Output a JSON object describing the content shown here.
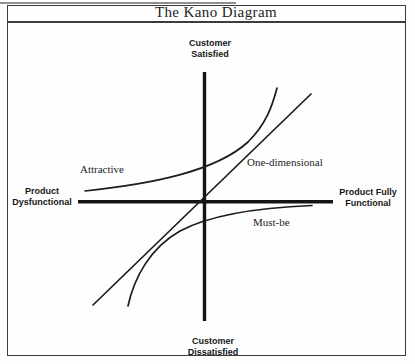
{
  "figure": {
    "title": "The Kano Diagram"
  },
  "axes": {
    "top_label": "Customer\nSatisfied",
    "bottom_label": "Customer\nDissatisfied",
    "left_label": "Product\nDysfunctional",
    "right_label": "Product Fully\nFunctional"
  },
  "curves": {
    "attractive": {
      "label": "Attractive",
      "shape": "concave-up curve, starts just above horizontal axis on left, rises steeply in upper right quadrant"
    },
    "one_dimensional": {
      "label": "One-dimensional",
      "shape": "straight diagonal line through the origin from lower-left to upper-right"
    },
    "must_be": {
      "label": "Must-be",
      "shape": "concave-down curve, rises steeply from lower-left, flattens just below horizontal axis to the right"
    }
  },
  "paths": {
    "vertical_axis": "M 204.5 72 L 204.5 321",
    "horizontal_axis": "M 78 201.7 L 333 201.7",
    "one_dimensional": "M 93 305 L 311 94",
    "attractive": "M 85 191 C 150 184 215 172 248 142 C 266 124 272 107 277 88",
    "must_be": "M 128 306 C 134 278 150 248 180 231 C 210 215 262 207.5 312 205.5"
  },
  "colors": {
    "ink": "#1c1c1c",
    "axis": "#141414",
    "border": "#3c3c3c",
    "background": "#fefefe"
  }
}
